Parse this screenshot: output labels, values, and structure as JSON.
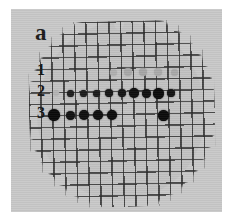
{
  "figure": {
    "panel_letter": "a",
    "background_color": "#ffffff",
    "panel_color": "#c9c9c9",
    "membrane_color": "#c2c2c2",
    "grid_line_color": "#2b2b2b"
  },
  "row_labels": [
    {
      "text": "1",
      "x": 37,
      "y": 62
    },
    {
      "text": "2",
      "x": 37,
      "y": 83
    },
    {
      "text": "3",
      "x": 37,
      "y": 105
    }
  ],
  "chart_data": {
    "type": "scatter",
    "title": "a",
    "xlabel": "",
    "ylabel": "",
    "series": [
      {
        "name": "1",
        "label": "Row 1 - faint spots",
        "intensity": "faint",
        "count": 5,
        "points": [
          {
            "x": 113,
            "y": 72,
            "d": 7,
            "color": "#b0b0b0"
          },
          {
            "x": 128,
            "y": 72,
            "d": 8,
            "color": "#a8a8a8"
          },
          {
            "x": 143,
            "y": 72,
            "d": 8,
            "color": "#a6a6a6"
          },
          {
            "x": 158,
            "y": 72,
            "d": 8,
            "color": "#aaaaaa"
          },
          {
            "x": 174,
            "y": 72,
            "d": 7,
            "color": "#a9a9a9"
          }
        ]
      },
      {
        "name": "2",
        "label": "Row 2 - dark spot series",
        "intensity": "dark",
        "count": 12,
        "points": [
          {
            "x": 56,
            "y": 93,
            "d": 6,
            "color": "#b4b4b4"
          },
          {
            "x": 70,
            "y": 93,
            "d": 7,
            "color": "#1d1d1d"
          },
          {
            "x": 83,
            "y": 93,
            "d": 7,
            "color": "#1b1b1b"
          },
          {
            "x": 96,
            "y": 93,
            "d": 7,
            "color": "#1c1c1c"
          },
          {
            "x": 109,
            "y": 93,
            "d": 8,
            "color": "#161616"
          },
          {
            "x": 122,
            "y": 93,
            "d": 8,
            "color": "#151515"
          },
          {
            "x": 134,
            "y": 93,
            "d": 10,
            "color": "#0d0d0d"
          },
          {
            "x": 146,
            "y": 93,
            "d": 9,
            "color": "#101010"
          },
          {
            "x": 158,
            "y": 93,
            "d": 11,
            "color": "#0b0b0b"
          },
          {
            "x": 171,
            "y": 93,
            "d": 8,
            "color": "#131313"
          }
        ]
      },
      {
        "name": "3",
        "label": "Row 3 - dark cluster plus isolated spot",
        "intensity": "dark",
        "count": 7,
        "points": [
          {
            "x": 54,
            "y": 115,
            "d": 12,
            "color": "#0a0a0a"
          },
          {
            "x": 70,
            "y": 115,
            "d": 9,
            "color": "#111111"
          },
          {
            "x": 84,
            "y": 115,
            "d": 10,
            "color": "#0f0f0f"
          },
          {
            "x": 98,
            "y": 115,
            "d": 10,
            "color": "#0e0e0e"
          },
          {
            "x": 112,
            "y": 115,
            "d": 10,
            "color": "#0d0d0d"
          },
          {
            "x": 163,
            "y": 115,
            "d": 11,
            "color": "#0b0b0b"
          }
        ]
      }
    ]
  }
}
